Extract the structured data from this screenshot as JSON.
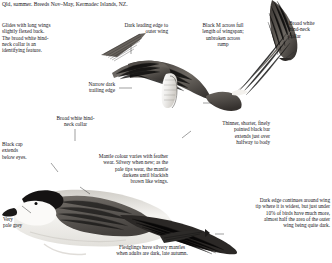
{
  "plate": {
    "header": "Qld, summer. Breeds Nov–May, Kermadec Islands, NZ.",
    "species_art": "kermadec-petrel-flight-and-perched-illustrations"
  },
  "captions": {
    "glides": "Glides with long wings\nslightly flexed back.\nThe broad white hind-\nneck collar is an\nidentifying feature.",
    "dark_leading_edge": "Dark leading edge to\nouter wing",
    "black_m": "Black M across full\nlength of wingspan;\nunbroken across\nrump",
    "broad_white_collar_top": "Broad white\nhind-neck\ncollar",
    "narrow_trailing": "Narrow dark\ntrailing edge",
    "broad_white_collar_left": "Broad white hind-\nneck collar",
    "black_cap": "Black cap\nextends\nbelow eyes.",
    "mantle_colour": "Mantle colour varies with feather\nwear. Silvery when new; as the\npale tips wear, the mantle\ndarkens until blackish\nbrown like wings.",
    "thinner_bar": "Thinner, shorter, finely\npointed black bar\nextends just over\nhalfway to body",
    "very_pale_grey": "Very\npale grey",
    "dark_edge": "Dark edge continues around wing\ntip where it is widest, but just under\n10% of birds have much more,\nalmost half the area of the outer\nwing being quite dark.",
    "fledglings": "Fledglings have silvery mantles\nwhen adults are dark, late autumn."
  },
  "colors": {
    "ink": "#17161a",
    "leader": "#2a2a2a",
    "wing_dark": "#2e2b2a",
    "body_light": "#f2f1ee",
    "grey_mid": "#8d8a85"
  }
}
